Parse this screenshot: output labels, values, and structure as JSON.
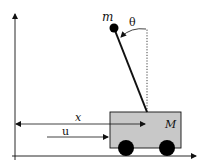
{
  "diagram": {
    "labels": {
      "pendulum_mass": "m",
      "angle": "θ",
      "cart_position": "x",
      "control_force": "u",
      "cart_mass": "M"
    },
    "colors": {
      "cart_fill": "#c8c8c8",
      "stroke": "#111111",
      "background": "#ffffff"
    },
    "elements": [
      "vertical-axis",
      "horizontal-axis",
      "cart",
      "wheels",
      "pendulum-rod",
      "pendulum-bob",
      "vertical-reference",
      "angle-arc",
      "position-arrow",
      "force-arrow"
    ]
  }
}
